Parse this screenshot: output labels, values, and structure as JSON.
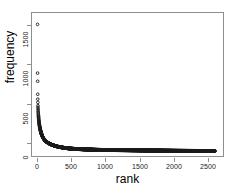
{
  "chart_data": {
    "type": "scatter",
    "title": "",
    "xlabel": "rank",
    "ylabel": "frequency",
    "xlim": [
      -80,
      2720
    ],
    "ylim": [
      -60,
      1700
    ],
    "xticks": [
      0,
      500,
      1000,
      1500,
      2000,
      2500
    ],
    "xticklabels": [
      "0",
      "500",
      "1000",
      "1500",
      "2000",
      "2500"
    ],
    "yticks": [
      0,
      500,
      1000,
      1500
    ],
    "yticklabels": [
      "0",
      "500",
      "1000",
      "1500"
    ],
    "grid": false,
    "legend": null,
    "marker": "open-circle",
    "marker_color": "#1a1a1a",
    "n_points": 2600,
    "x": [
      1,
      2,
      3,
      4,
      5,
      6,
      7,
      8,
      9,
      10,
      12,
      14,
      16,
      18,
      20,
      24,
      28,
      32,
      36,
      40,
      46,
      52,
      60,
      70,
      80,
      95,
      110,
      130,
      150,
      175,
      200,
      230,
      260,
      300,
      340,
      380,
      430,
      480,
      540,
      600,
      670,
      740,
      820,
      900,
      990,
      1080,
      1180,
      1280,
      1390,
      1500,
      1620,
      1740,
      1870,
      2000,
      2140,
      2280,
      2430,
      2580,
      2600
    ],
    "y": [
      1560,
      960,
      860,
      700,
      640,
      600,
      560,
      540,
      520,
      500,
      470,
      440,
      420,
      400,
      380,
      350,
      325,
      300,
      285,
      270,
      248,
      230,
      208,
      186,
      168,
      148,
      132,
      116,
      104,
      92,
      82,
      72,
      64,
      55,
      48,
      42,
      36,
      32,
      28,
      25,
      22,
      20,
      18,
      16,
      14,
      13,
      12,
      11,
      10,
      9,
      8,
      7,
      6,
      5,
      4,
      3,
      2,
      1,
      1
    ]
  }
}
